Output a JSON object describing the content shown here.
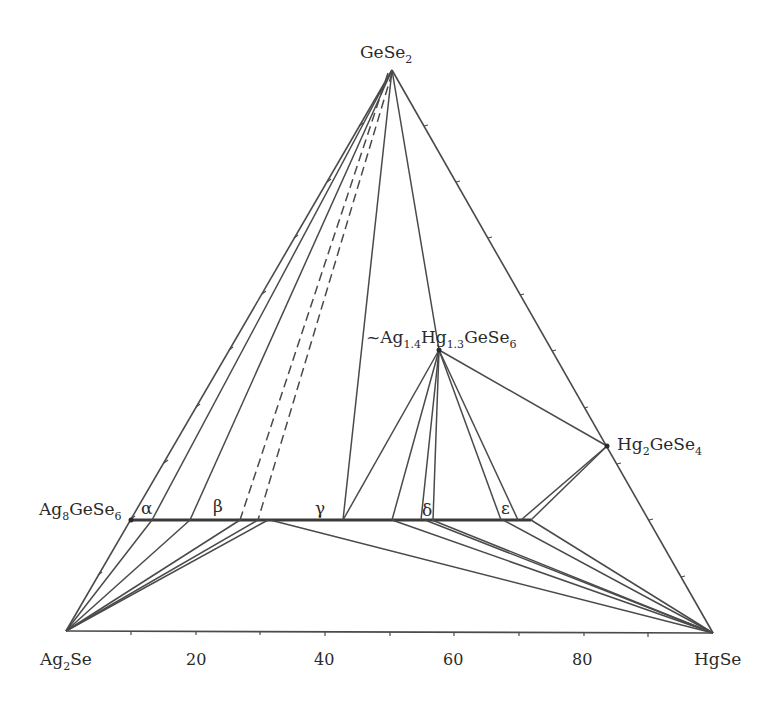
{
  "diagram": {
    "type": "ternary-phase-diagram",
    "vertices": {
      "top": {
        "label": "GeSe",
        "sub": "2",
        "x": 392,
        "y": 70
      },
      "bottom_left": {
        "label": "Ag",
        "sub": "2",
        "tail": "Se",
        "x": 66,
        "y": 631
      },
      "bottom_right": {
        "label": "HgSe",
        "x": 713,
        "y": 633
      }
    },
    "compounds": {
      "ag8gese6": {
        "parts": [
          "Ag",
          "8",
          "GeSe",
          "6"
        ],
        "x": 131,
        "y": 520
      },
      "quaternary": {
        "parts": [
          "~Ag",
          "1.4",
          "Hg",
          "1.3",
          "GeSe",
          "6"
        ],
        "x": 439,
        "y": 350
      },
      "hg2gese4": {
        "parts": [
          "Hg",
          "2",
          "GeSe",
          "4"
        ],
        "x": 607,
        "y": 446
      }
    },
    "phase_labels": [
      {
        "text": "α",
        "x": 147,
        "y": 515
      },
      {
        "text": "β",
        "x": 220,
        "y": 512
      },
      {
        "text": "γ",
        "x": 321,
        "y": 514
      },
      {
        "text": "δ",
        "x": 427,
        "y": 516
      },
      {
        "text": "ε",
        "x": 507,
        "y": 514
      }
    ],
    "axis": {
      "tick_labels": [
        "20",
        "40",
        "60",
        "80"
      ],
      "tick_values": [
        20,
        40,
        60,
        80
      ]
    },
    "solid_solution_line": {
      "x1": 131,
      "x2": 531,
      "y": 520
    },
    "colors": {
      "line": "#4a4a4a",
      "text": "#2a2a2a"
    }
  }
}
